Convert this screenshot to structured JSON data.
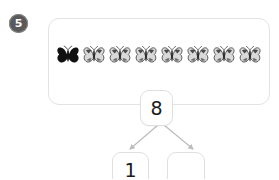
{
  "question": {
    "number": "5"
  },
  "objects_panel": {
    "item_icon": "butterfly-icon",
    "count": 8,
    "items": [
      {
        "style": "dark"
      },
      {
        "style": "light"
      },
      {
        "style": "light"
      },
      {
        "style": "light"
      },
      {
        "style": "light"
      },
      {
        "style": "light"
      },
      {
        "style": "light"
      },
      {
        "style": "light"
      }
    ]
  },
  "number_bond": {
    "total": "8",
    "part_left": "1",
    "part_right": "",
    "arrow_color": "#bdbdbd"
  },
  "colors": {
    "background": "#ffffff",
    "panel_border": "#e3e3e3",
    "box_border": "#e0e0e0",
    "badge_fill": "#5a5a5a",
    "badge_text": "#ffffff",
    "number_text": "#1b1b1b"
  }
}
